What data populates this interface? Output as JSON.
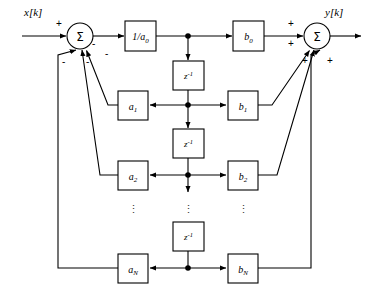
{
  "figure": {
    "type": "signal-flow-block-diagram",
    "input_label": "x[k]",
    "output_label": "y[k]",
    "summing_symbol": "Σ"
  },
  "blocks": {
    "gain_input": {
      "base": "1/a",
      "sub": "0"
    },
    "feedback": [
      {
        "base": "a",
        "sub": "1"
      },
      {
        "base": "a",
        "sub": "2"
      },
      {
        "base": "a",
        "sub": "N"
      }
    ],
    "feedforward": [
      {
        "base": "b",
        "sub": "0"
      },
      {
        "base": "b",
        "sub": "1"
      },
      {
        "base": "b",
        "sub": "2"
      },
      {
        "base": "b",
        "sub": "N"
      }
    ],
    "delay": {
      "base": "z",
      "sup": "-1"
    },
    "delay_count": 3
  },
  "signs": {
    "left_sum_input": "+",
    "left_sum_feedback": [
      "-",
      "-",
      "-",
      "-"
    ],
    "right_sum_inputs": [
      "+",
      "+",
      "+",
      "+"
    ]
  },
  "ellipsis": {
    "glyph": "⋮",
    "columns": [
      "feedback",
      "delay",
      "feedforward"
    ]
  },
  "colors": {
    "line": "#000000",
    "fill": "#ffffff",
    "dots": "#3a3a3a"
  }
}
